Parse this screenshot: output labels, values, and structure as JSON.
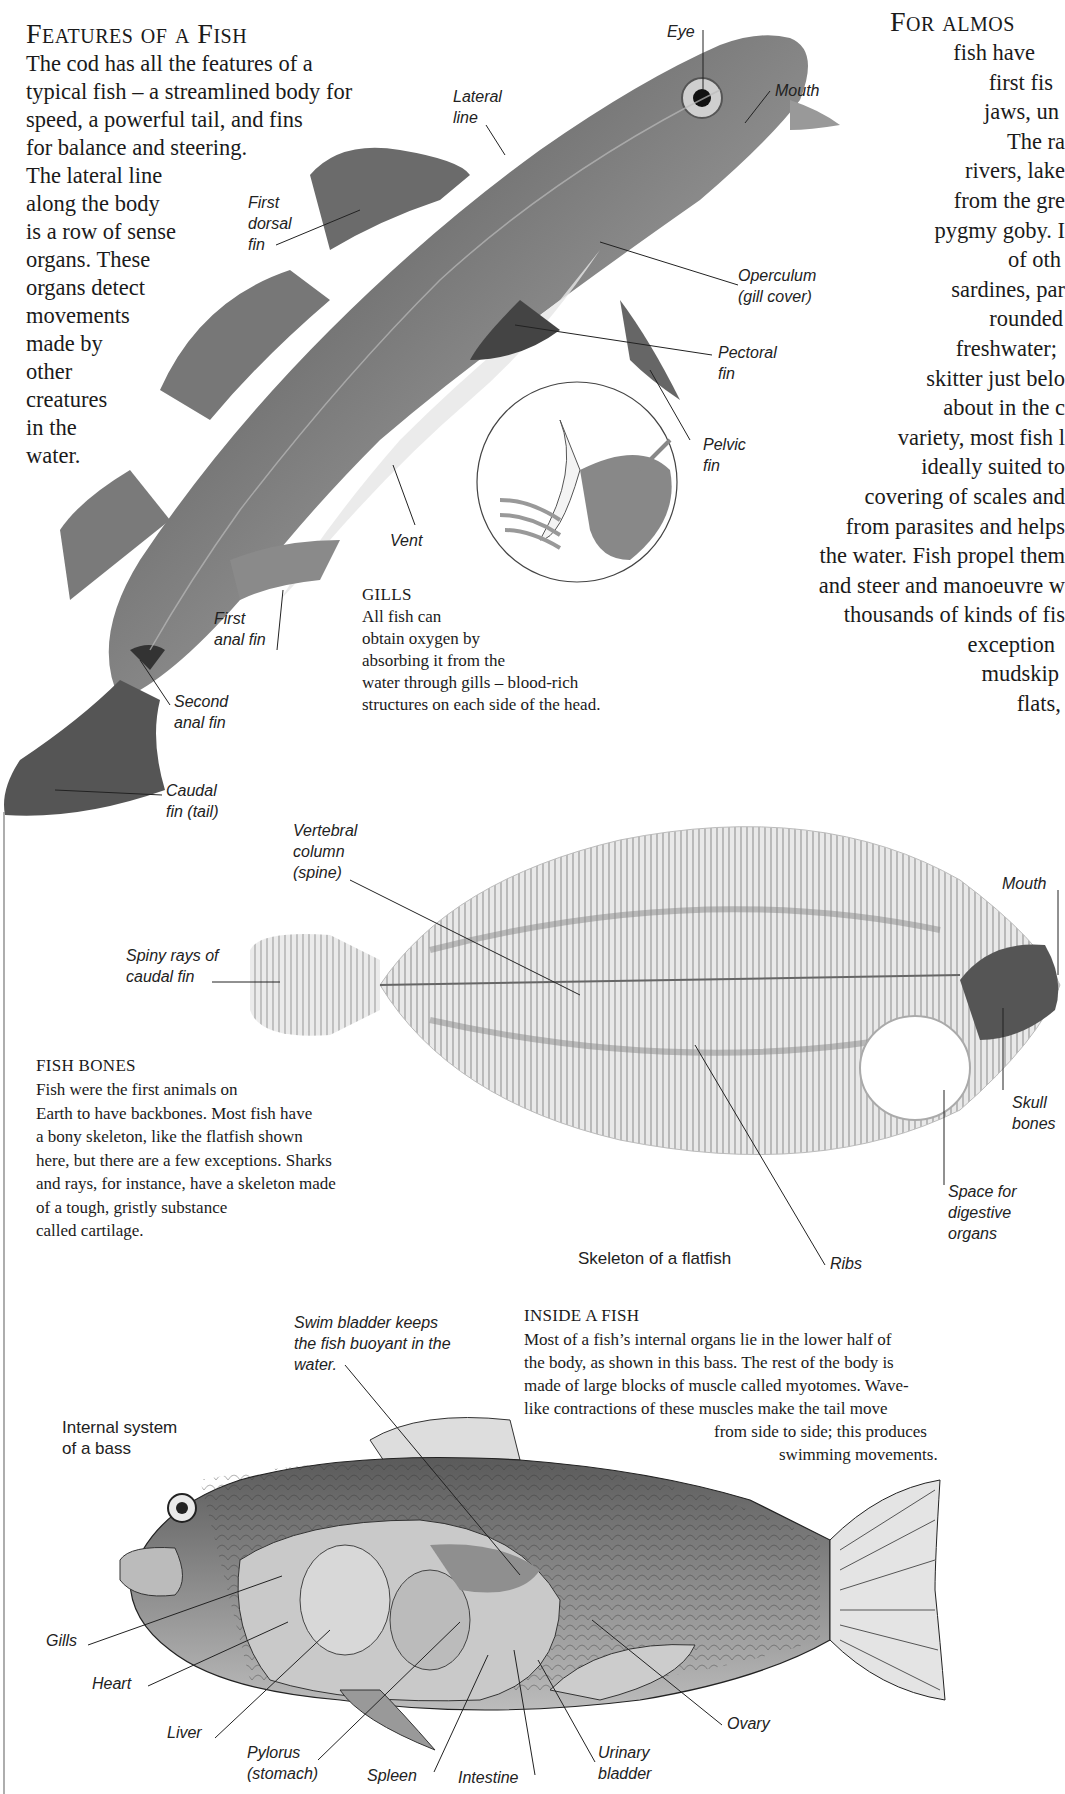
{
  "features": {
    "heading": "Features of a Fish",
    "intro_lines": [
      "The cod has all the features of a",
      "typical fish – a streamlined body for",
      "speed, a powerful tail, and fins",
      "for balance and steering.",
      "The lateral line",
      "along the body",
      "is a row of sense",
      "organs. These",
      "organs detect",
      "movements",
      "made by",
      "other",
      "creatures",
      "in the",
      "water."
    ]
  },
  "cod_labels": {
    "eye": "Eye",
    "mouth": "Mouth",
    "lateral_line": "Lateral\nline",
    "first_dorsal_fin": "First\ndorsal\nfin",
    "operculum": "Operculum\n(gill cover)",
    "pectoral_fin": "Pectoral\nfin",
    "pelvic_fin": "Pelvic\nfin",
    "vent": "Vent",
    "first_anal_fin": "First\nanal fin",
    "second_anal_fin": "Second\nanal fin",
    "caudal_fin": "Caudal\nfin (tail)"
  },
  "gills": {
    "heading": "Gills",
    "lines": [
      "All fish can",
      "obtain oxygen by",
      "absorbing it from the",
      "water through gills – blood-rich",
      "structures on each side of the head."
    ]
  },
  "intro_right": {
    "heading": "For almos",
    "lines": [
      "fish have",
      "first fis",
      "jaws, un",
      "The ra",
      "rivers, lake",
      "from the gre",
      "pygmy goby. I",
      "of oth",
      "sardines, par",
      "rounded",
      "freshwater;",
      "skitter just belo",
      "about in the c",
      "variety, most fish l",
      "ideally suited to",
      "covering of scales and",
      "from parasites and helps",
      "the water. Fish propel them",
      "and steer and manoeuvre w",
      "thousands of kinds of fis",
      "exception",
      "mudskip",
      "flats,"
    ]
  },
  "flatfish_labels": {
    "vertebral_column": "Vertebral\ncolumn\n(spine)",
    "spiny_rays": "Spiny rays of\ncaudal fin",
    "mouth": "Mouth",
    "skull_bones": "Skull\nbones",
    "digestive_space": "Space for\ndigestive\norgans",
    "ribs": "Ribs",
    "caption": "Skeleton of a flatfish"
  },
  "fish_bones": {
    "heading": "Fish Bones",
    "lines": [
      "Fish were the first animals on",
      "Earth to have backbones. Most fish have",
      "a bony skeleton, like the flatfish shown",
      "here, but there are a few exceptions. Sharks",
      "and rays, for instance, have a skeleton made",
      "of a tough, gristly substance",
      "called cartilage."
    ]
  },
  "inside_fish": {
    "heading": "Inside a Fish",
    "lines": [
      "Most of a fish’s internal organs lie in the lower half of",
      "the body, as shown in this bass. The rest of the body is",
      "made of large blocks of muscle called myotomes. Wave-",
      "like contractions of these muscles make the tail move",
      "from side to side; this produces",
      "swimming movements."
    ]
  },
  "bass_labels": {
    "caption": "Internal system\nof a bass",
    "swim_bladder": "Swim bladder keeps\nthe fish buoyant in the\nwater.",
    "gills": "Gills",
    "heart": "Heart",
    "liver": "Liver",
    "pylorus": "Pylorus\n(stomach)",
    "spleen": "Spleen",
    "intestine": "Intestine",
    "urinary_bladder": "Urinary\nbladder",
    "ovary": "Ovary"
  }
}
